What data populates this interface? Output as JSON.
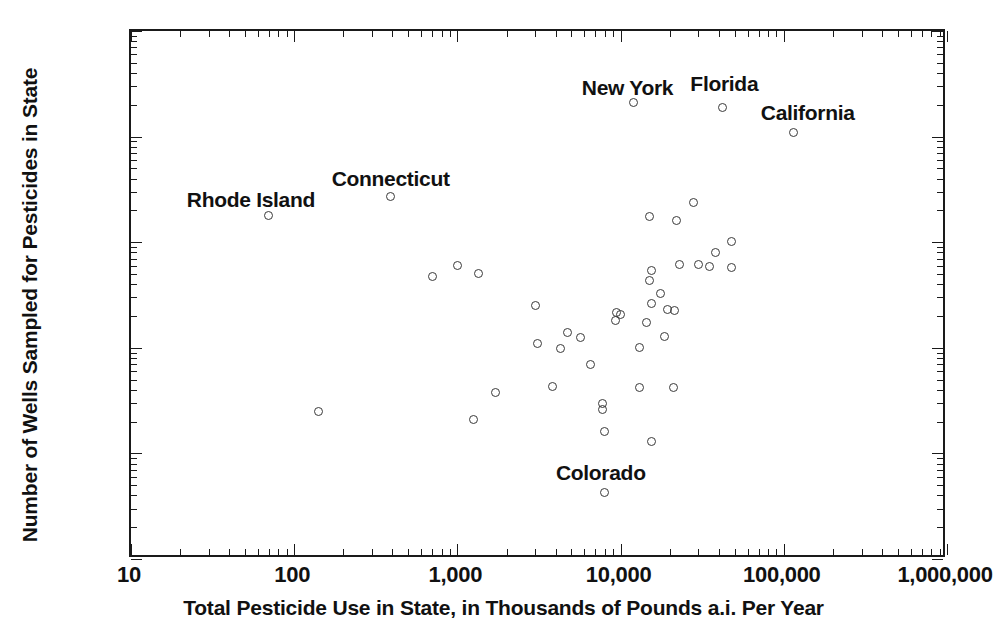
{
  "chart_data": {
    "type": "scatter",
    "title": "",
    "xlabel": "Total Pesticide Use in State, in Thousands of Pounds a.i. Per Year",
    "ylabel": "Number of Wells Sampled for Pesticides in State",
    "xscale": "log",
    "yscale": "log",
    "xlim": [
      10,
      1000000
    ],
    "ylim": [
      1,
      100000
    ],
    "grid": false,
    "legend": null,
    "xticks": [
      {
        "value": 10,
        "label": "10"
      },
      {
        "value": 100,
        "label": "100"
      },
      {
        "value": 1000,
        "label": "1,000"
      },
      {
        "value": 10000,
        "label": "10,000"
      },
      {
        "value": 100000,
        "label": "100,000"
      },
      {
        "value": 1000000,
        "label": "1,000,000"
      }
    ],
    "yticks": [
      {
        "value": 1,
        "label": "1"
      },
      {
        "value": 10,
        "label": "10"
      },
      {
        "value": 100,
        "label": "100"
      },
      {
        "value": 1000,
        "label": "1,000"
      },
      {
        "value": 10000,
        "label": "10,000"
      },
      {
        "value": 100000,
        "label": "100,000"
      }
    ],
    "marker": {
      "shape": "circle-open",
      "edge_color": "#3a3a3a",
      "size_px": 9
    },
    "points": [
      {
        "label": "New York",
        "x": 12000,
        "y": 21000
      },
      {
        "label": "Florida",
        "x": 42000,
        "y": 19000
      },
      {
        "label": "California",
        "x": 115000,
        "y": 11000
      },
      {
        "label": "Connecticut",
        "x": 390,
        "y": 2700
      },
      {
        "label": "Rhode Island",
        "x": 70,
        "y": 1800
      },
      {
        "label": "Colorado",
        "x": 8000,
        "y": 4.3
      },
      {
        "label": null,
        "x": 28000,
        "y": 2400
      },
      {
        "label": null,
        "x": 15000,
        "y": 1750
      },
      {
        "label": null,
        "x": 22000,
        "y": 1600
      },
      {
        "label": null,
        "x": 48000,
        "y": 1020
      },
      {
        "label": null,
        "x": 38000,
        "y": 800
      },
      {
        "label": null,
        "x": 23000,
        "y": 610
      },
      {
        "label": null,
        "x": 30000,
        "y": 610
      },
      {
        "label": null,
        "x": 35000,
        "y": 585
      },
      {
        "label": null,
        "x": 48000,
        "y": 580
      },
      {
        "label": null,
        "x": 1000,
        "y": 600
      },
      {
        "label": null,
        "x": 1350,
        "y": 510
      },
      {
        "label": null,
        "x": 700,
        "y": 470
      },
      {
        "label": null,
        "x": 15500,
        "y": 540
      },
      {
        "label": null,
        "x": 15000,
        "y": 430
      },
      {
        "label": null,
        "x": 17500,
        "y": 330
      },
      {
        "label": null,
        "x": 15500,
        "y": 265
      },
      {
        "label": null,
        "x": 3000,
        "y": 250
      },
      {
        "label": null,
        "x": 9500,
        "y": 215
      },
      {
        "label": null,
        "x": 10000,
        "y": 208
      },
      {
        "label": null,
        "x": 19500,
        "y": 230
      },
      {
        "label": null,
        "x": 21500,
        "y": 225
      },
      {
        "label": null,
        "x": 9300,
        "y": 180
      },
      {
        "label": null,
        "x": 14500,
        "y": 175
      },
      {
        "label": null,
        "x": 4700,
        "y": 140
      },
      {
        "label": null,
        "x": 5700,
        "y": 125
      },
      {
        "label": null,
        "x": 18500,
        "y": 128
      },
      {
        "label": null,
        "x": 3100,
        "y": 110
      },
      {
        "label": null,
        "x": 4300,
        "y": 98
      },
      {
        "label": null,
        "x": 13000,
        "y": 100
      },
      {
        "label": null,
        "x": 6500,
        "y": 70
      },
      {
        "label": null,
        "x": 3800,
        "y": 43
      },
      {
        "label": null,
        "x": 13000,
        "y": 42
      },
      {
        "label": null,
        "x": 21000,
        "y": 42
      },
      {
        "label": null,
        "x": 1700,
        "y": 38
      },
      {
        "label": null,
        "x": 7800,
        "y": 30
      },
      {
        "label": null,
        "x": 7800,
        "y": 26
      },
      {
        "label": null,
        "x": 140,
        "y": 25
      },
      {
        "label": null,
        "x": 1250,
        "y": 21
      },
      {
        "label": null,
        "x": 8000,
        "y": 16
      },
      {
        "label": null,
        "x": 15500,
        "y": 13
      }
    ]
  }
}
